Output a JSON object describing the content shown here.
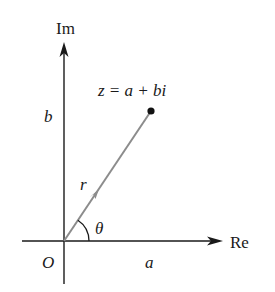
{
  "diagram": {
    "axes": {
      "imaginary_label": "Im",
      "real_label": "Re"
    },
    "labels": {
      "origin": "O",
      "real_part": "a",
      "imaginary_part": "b",
      "modulus": "r",
      "angle": "θ",
      "point": "z = a + bi"
    },
    "colors": {
      "axes": "#1a1a1a",
      "vector": "#8c8c8c",
      "point": "#111111"
    }
  }
}
